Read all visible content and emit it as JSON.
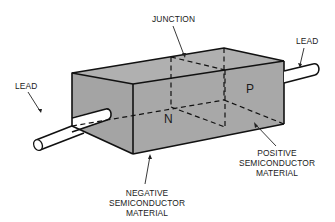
{
  "diagram": {
    "colors": {
      "block_fill": "#a9a9a9",
      "block_fill_top": "#b3b3b3",
      "block_fill_end": "#a3a3a3",
      "lead_fill": "#ffffff",
      "line": "#111111",
      "background": "#ffffff"
    },
    "labels": {
      "junction": "JUNCTION",
      "lead_left": "LEAD",
      "lead_right": "LEAD",
      "region_n": "N",
      "region_p": "P",
      "negative_line1": "NEGATIVE",
      "negative_line2": "SEMICONDUCTOR",
      "negative_line3": "MATERIAL",
      "positive_line1": "POSITIVE",
      "positive_line2": "SEMICONDUCTOR",
      "positive_line3": "MATERIAL"
    }
  }
}
